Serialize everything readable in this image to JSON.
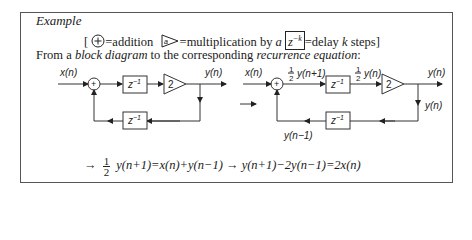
{
  "example": {
    "heading": "Example",
    "legend": {
      "open": "[",
      "addition": "=addition",
      "multiplication": "=multiplication by ",
      "a": "a",
      "delay_box": "z",
      "delay_exp": "−k",
      "delay": "=delay ",
      "k": "k",
      "steps": " steps]",
      "mult_symbol": "a"
    },
    "intro": {
      "part1": "From a ",
      "block_diagram": "block diagram",
      "part2": " to the corresponding ",
      "recurrence": "recurrence equation",
      "colon": ":"
    },
    "left_diagram": {
      "input": "x(n)",
      "output": "y(n)",
      "delay_top": "z",
      "delay_bottom": "z",
      "delay_exp": "−1",
      "gain": "2",
      "sum": "+"
    },
    "right_diagram": {
      "input": "x(n)",
      "half": "1",
      "half_den": "2",
      "sig1": "y(n+1)",
      "sig2": "y(n)",
      "output": "y(n)",
      "feedback_out": "y(n)",
      "feedback_in": "y(n−1)",
      "delay_exp": "−1",
      "delay": "z",
      "gain": "2",
      "sum": "+"
    },
    "equation": {
      "arrow1": "→",
      "num": "1",
      "den": "2",
      "eq1": "y(n+1)=x(n)+y(n−1)",
      "arrow2": "→",
      "eq2": "y(n+1)−2y(n−1)=2x(n)"
    }
  }
}
